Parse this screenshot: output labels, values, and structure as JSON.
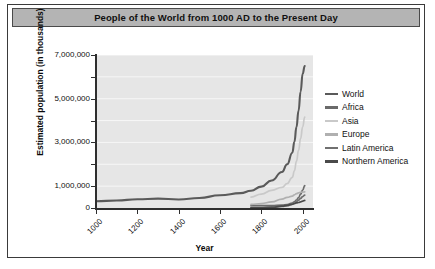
{
  "chart": {
    "title": "People of the World from 1000 AD to the Present Day"
  },
  "chart_data": {
    "type": "line",
    "title": "People of the World from 1000 AD to the Present Day",
    "xlabel": "Year",
    "ylabel": "Estimated population (in thousands)",
    "xlim": [
      1000,
      2050
    ],
    "ylim": [
      0,
      7000000
    ],
    "grid": true,
    "legend_position": "right",
    "x_tick_labels": [
      "1000",
      "1200",
      "1400",
      "1600",
      "1800",
      "2000"
    ],
    "x_ticks": [
      1000,
      1200,
      1400,
      1600,
      1800,
      2000
    ],
    "y_tick_labels": [
      "0",
      "1,000,000",
      "3,000,000",
      "5,000,000",
      "7,000,000"
    ],
    "y_ticks": [
      0,
      1000000,
      3000000,
      5000000,
      7000000
    ],
    "y_minor_ticks": [
      2000000,
      4000000,
      6000000
    ],
    "series": [
      {
        "name": "World",
        "color": "#5a5a5a",
        "x": [
          1000,
          1100,
          1200,
          1300,
          1400,
          1500,
          1600,
          1700,
          1750,
          1800,
          1850,
          1900,
          1925,
          1950,
          1960,
          1970,
          1980,
          1990,
          2000,
          2010
        ],
        "values": [
          310000,
          340000,
          400000,
          430000,
          390000,
          460000,
          580000,
          680000,
          790000,
          980000,
          1260000,
          1650000,
          2000000,
          2530000,
          3030000,
          3700000,
          4450000,
          5320000,
          6140000,
          6500000
        ]
      },
      {
        "name": "Africa",
        "color": "#6a6a6a",
        "x": [
          1750,
          1800,
          1850,
          1900,
          1925,
          1950,
          1960,
          1970,
          1980,
          1990,
          2000,
          2010
        ],
        "values": [
          106000,
          107000,
          111000,
          133000,
          160000,
          229000,
          285000,
          366000,
          477000,
          632000,
          814000,
          1022000
        ]
      },
      {
        "name": "Asia",
        "color": "#c9c9c9",
        "x": [
          1750,
          1800,
          1850,
          1900,
          1925,
          1950,
          1960,
          1970,
          1980,
          1990,
          2000,
          2010
        ],
        "values": [
          502000,
          635000,
          809000,
          947000,
          1120000,
          1402000,
          1700000,
          2143000,
          2632000,
          3181000,
          3714000,
          4164000
        ]
      },
      {
        "name": "Europe",
        "color": "#b0b0b0",
        "x": [
          1750,
          1800,
          1850,
          1900,
          1925,
          1950,
          1960,
          1970,
          1980,
          1990,
          2000,
          2010
        ],
        "values": [
          163000,
          203000,
          276000,
          408000,
          485000,
          547000,
          605000,
          656000,
          694000,
          721000,
          727000,
          738000
        ]
      },
      {
        "name": "Latin America",
        "color": "#707070",
        "x": [
          1750,
          1800,
          1850,
          1900,
          1925,
          1950,
          1960,
          1970,
          1980,
          1990,
          2000,
          2010
        ],
        "values": [
          16000,
          24000,
          38000,
          74000,
          99000,
          167000,
          218000,
          286000,
          362000,
          443000,
          521000,
          590000
        ]
      },
      {
        "name": "Northern America",
        "color": "#4a4a4a",
        "x": [
          1750,
          1800,
          1850,
          1900,
          1925,
          1950,
          1960,
          1970,
          1980,
          1990,
          2000,
          2010
        ],
        "values": [
          2000,
          7000,
          26000,
          82000,
          125000,
          172000,
          204000,
          232000,
          252000,
          282000,
          314000,
          345000
        ]
      }
    ]
  },
  "legend": {
    "items": [
      {
        "label": "World",
        "color": "#5a5a5a"
      },
      {
        "label": "Africa",
        "color": "#6a6a6a"
      },
      {
        "label": "Asia",
        "color": "#c9c9c9"
      },
      {
        "label": "Europe",
        "color": "#b0b0b0"
      },
      {
        "label": "Latin America",
        "color": "#707070"
      },
      {
        "label": "Northern America",
        "color": "#4a4a4a"
      }
    ]
  }
}
